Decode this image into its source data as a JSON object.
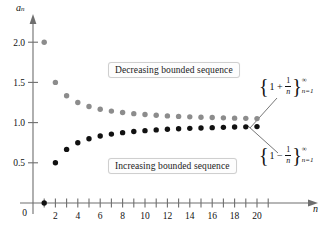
{
  "figure": {
    "background": "#ffffff",
    "axis_color": "#6e6e6e",
    "gray_series_color": "#8c8c8c",
    "black_series_color": "#111111"
  },
  "axes": {
    "y_label": "a",
    "y_label_sub": "n",
    "x_label": "n",
    "y_ticks": [
      "2.0",
      "1.5",
      "1.0",
      "0.5"
    ],
    "y_tick_values": [
      2.0,
      1.5,
      1.0,
      0.5
    ],
    "origin_label": "0",
    "x_ticks": [
      "2",
      "4",
      "6",
      "8",
      "10",
      "12",
      "14",
      "16",
      "18",
      "20"
    ],
    "x_tick_values": [
      2,
      4,
      6,
      8,
      10,
      12,
      14,
      16,
      18,
      20
    ]
  },
  "annotations": {
    "decreasing_caption": "Decreasing bounded sequence",
    "increasing_caption": "Increasing bounded sequence",
    "upper_expression": {
      "open": "{",
      "one": "1",
      "op": "+",
      "frac_num": "1",
      "frac_den": "n",
      "close": "}",
      "sup": "∞",
      "sub": "n=1"
    },
    "lower_expression": {
      "open": "{",
      "one": "1",
      "op": "−",
      "frac_num": "1",
      "frac_den": "n",
      "close": "}",
      "sup": "∞",
      "sub": "n=1"
    }
  },
  "chart_data": {
    "type": "scatter",
    "title": "",
    "xlabel": "n",
    "ylabel": "a_n",
    "xlim": [
      0,
      21.5
    ],
    "ylim": [
      0,
      2.25
    ],
    "grid": false,
    "legend": "callout-labels",
    "x": [
      1,
      2,
      3,
      4,
      5,
      6,
      7,
      8,
      9,
      10,
      11,
      12,
      13,
      14,
      15,
      16,
      17,
      18,
      19,
      20
    ],
    "series": [
      {
        "name": "{1 + 1/n}",
        "color": "#8c8c8c",
        "description": "Decreasing bounded sequence",
        "values": [
          2.0,
          1.5,
          1.3333,
          1.25,
          1.2,
          1.1667,
          1.1429,
          1.125,
          1.1111,
          1.1,
          1.0909,
          1.0833,
          1.0769,
          1.0714,
          1.0667,
          1.0625,
          1.0588,
          1.0556,
          1.0526,
          1.05
        ]
      },
      {
        "name": "{1 - 1/n}",
        "color": "#111111",
        "description": "Increasing bounded sequence",
        "values": [
          0.0,
          0.5,
          0.6667,
          0.75,
          0.8,
          0.8333,
          0.8571,
          0.875,
          0.8889,
          0.9,
          0.9091,
          0.9167,
          0.9231,
          0.9286,
          0.9333,
          0.9375,
          0.9412,
          0.9444,
          0.9474,
          0.95
        ]
      }
    ]
  }
}
